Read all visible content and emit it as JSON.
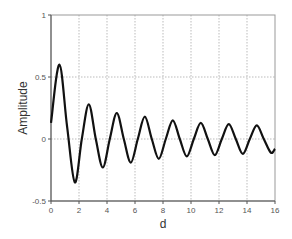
{
  "chart_data": {
    "type": "line",
    "title": "",
    "xlabel": "d",
    "ylabel": "Amplitude",
    "xlim": [
      0,
      16
    ],
    "ylim": [
      -0.5,
      1
    ],
    "grid": true,
    "x_ticks": [
      "0",
      "2",
      "4",
      "6",
      "8",
      "10",
      "12",
      "14",
      "16"
    ],
    "y_ticks": [
      "-0.5",
      "0",
      "0.5",
      "1"
    ],
    "series": [
      {
        "name": "Amplitude",
        "color": "#111111",
        "x": [
          0,
          0.6,
          1.15,
          1.7,
          2.2,
          2.7,
          3.2,
          3.7,
          4.2,
          4.7,
          5.2,
          5.7,
          6.2,
          6.7,
          7.2,
          7.7,
          8.2,
          8.7,
          9.2,
          9.7,
          10.2,
          10.7,
          11.2,
          11.7,
          12.2,
          12.7,
          13.2,
          13.7,
          14.2,
          14.7,
          15.2,
          15.7,
          16
        ],
        "values": [
          0.13,
          0.6,
          0.1,
          -0.35,
          0.0,
          0.28,
          0.0,
          -0.23,
          0.0,
          0.21,
          0.0,
          -0.19,
          0.0,
          0.18,
          0.0,
          -0.16,
          0.0,
          0.15,
          0.0,
          -0.14,
          0.0,
          0.13,
          0.0,
          -0.13,
          0.0,
          0.12,
          0.0,
          -0.12,
          0.0,
          0.11,
          0.0,
          -0.11,
          -0.08
        ]
      }
    ]
  }
}
